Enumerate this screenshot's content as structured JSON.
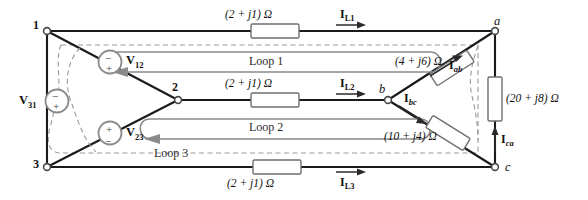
{
  "figure": {
    "type": "circuit-diagram"
  },
  "nodes": [
    {
      "id": "n1",
      "label": "1",
      "x": 47,
      "y": 31
    },
    {
      "id": "n2",
      "label": "2",
      "x": 178,
      "y": 100
    },
    {
      "id": "n3",
      "label": "3",
      "x": 47,
      "y": 167
    },
    {
      "id": "na",
      "label": "a",
      "x": 495,
      "y": 31
    },
    {
      "id": "nb",
      "label": "b",
      "x": 388,
      "y": 100
    },
    {
      "id": "nc",
      "label": "c",
      "x": 495,
      "y": 167
    }
  ],
  "sources": [
    {
      "id": "v12",
      "label": "V",
      "sub": "12",
      "x": 110,
      "y": 62,
      "plus": "bottom",
      "minus": "top"
    },
    {
      "id": "v23",
      "label": "V",
      "sub": "23",
      "x": 110,
      "y": 133,
      "plus": "top",
      "minus": "bottom"
    },
    {
      "id": "v31",
      "label": "V",
      "sub": "31",
      "x": 57,
      "y": 101,
      "plus": "bottom",
      "minus": "top"
    }
  ],
  "impedances": [
    {
      "id": "z-line1",
      "text": "(2 + j1) Ω",
      "x": 275,
      "y": 31,
      "label_x": 275,
      "label_y": 16
    },
    {
      "id": "z-line2",
      "text": "(2 + j1) Ω",
      "x": 275,
      "y": 100,
      "label_x": 275,
      "label_y": 85
    },
    {
      "id": "z-line3",
      "text": "(2 + j1) Ω",
      "x": 277,
      "y": 167,
      "label_x": 277,
      "label_y": 182
    },
    {
      "id": "z-ab",
      "text": "(4 + j6) Ω",
      "x": 452,
      "y": 68,
      "label_x": 424,
      "label_y": 63
    },
    {
      "id": "z-bc",
      "text": "(10 + j4) Ω",
      "x": 448,
      "y": 133,
      "label_x": 418,
      "label_y": 137
    },
    {
      "id": "z-ca",
      "text": "(20 + j8) Ω",
      "x": 495,
      "y": 99,
      "label_x": 510,
      "label_y": 99
    }
  ],
  "currents": [
    {
      "id": "i-l1",
      "label": "I",
      "sub": "L1",
      "x": 350,
      "y": 20,
      "arrow": "right"
    },
    {
      "id": "i-l2",
      "label": "I",
      "sub": "L2",
      "x": 350,
      "y": 89,
      "arrow": "right"
    },
    {
      "id": "i-l3",
      "label": "I",
      "sub": "L3",
      "x": 350,
      "y": 180,
      "arrow": "right"
    },
    {
      "id": "i-ab",
      "label": "I",
      "sub": "ab",
      "x": 448,
      "y": 61,
      "arrow": "up-right"
    },
    {
      "id": "i-bc",
      "label": "I",
      "sub": "bc",
      "x": 412,
      "y": 101,
      "arrow": "down-right"
    },
    {
      "id": "i-ca",
      "label": "I",
      "sub": "ca",
      "x": 505,
      "y": 140,
      "arrow": "up"
    }
  ],
  "loops": [
    {
      "id": "loop1",
      "label": "Loop 1",
      "x": 275,
      "y": 60
    },
    {
      "id": "loop2",
      "label": "Loop 2",
      "x": 275,
      "y": 126
    },
    {
      "id": "loop3",
      "label": "Loop 3",
      "x": 182,
      "y": 152
    }
  ],
  "colors": {
    "wire": "#1a1a1a",
    "loop": "#8a8a8a",
    "loop_dashed": "#9a9a9a",
    "component_stroke": "#6f6f6f",
    "component_fill": "#ffffff",
    "text": "#111111"
  }
}
